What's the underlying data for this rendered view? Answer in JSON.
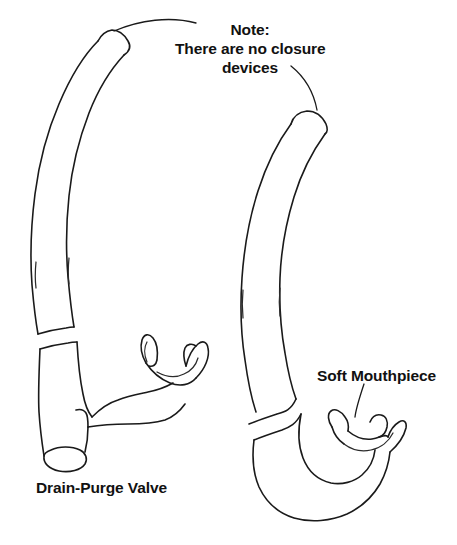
{
  "figure": {
    "background_color": "#ffffff",
    "ink_color": "#1a1a1a",
    "width": 457,
    "height": 545
  },
  "annotations": {
    "note": {
      "name": "note-callout",
      "text": "Note:\nThere are no closure\ndevices",
      "lines": [
        "Note:",
        "There are no closure",
        "devices"
      ],
      "leader_count": 2
    },
    "drain_purge": {
      "name": "drain-purge-valve-label",
      "text": "Drain-Purge Valve"
    },
    "soft_mouthpiece": {
      "name": "soft-mouthpiece-label",
      "text": "Soft Mouthpiece"
    }
  },
  "objects": [
    {
      "name": "snorkel-left",
      "description": "Snorkel shown with drain-purge valve at lower barrel end",
      "parts": [
        "tube",
        "corrugated-band",
        "mouthpiece",
        "drain-purge-valve"
      ]
    },
    {
      "name": "snorkel-right",
      "description": "Snorkel shown with soft mouthpiece curving to the right",
      "parts": [
        "tube",
        "corrugated-band",
        "soft-mouthpiece"
      ]
    }
  ]
}
